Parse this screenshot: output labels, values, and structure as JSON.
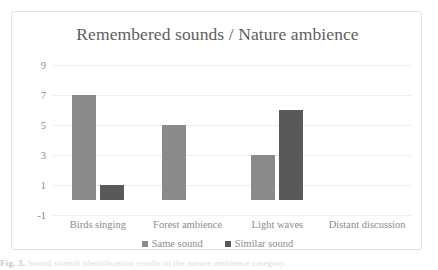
{
  "chart_data": {
    "type": "bar",
    "title": "Remembered sounds / Nature ambience",
    "xlabel": "",
    "ylabel": "",
    "categories": [
      "Birds singing",
      "Forest ambience",
      "Light waves",
      "Distant discussion"
    ],
    "series": [
      {
        "name": "Same sound",
        "color": "#8a8a8a",
        "values": [
          7,
          5,
          3,
          0
        ]
      },
      {
        "name": "Similar sound",
        "color": "#595959",
        "values": [
          1,
          0,
          6,
          0
        ]
      }
    ],
    "ylim": [
      -1,
      9
    ],
    "yticks": [
      9,
      7,
      5,
      3,
      1,
      -1
    ],
    "grid": true,
    "legend_position": "bottom"
  },
  "axis": {
    "ticks": [
      {
        "label": "9",
        "value": 9
      },
      {
        "label": "7",
        "value": 7
      },
      {
        "label": "5",
        "value": 5
      },
      {
        "label": "3",
        "value": 3
      },
      {
        "label": "1",
        "value": 1
      },
      {
        "label": "-1",
        "value": -1
      }
    ]
  },
  "legend": {
    "items": [
      {
        "label": "Same sound",
        "color": "#8a8a8a"
      },
      {
        "label": "Similar sound",
        "color": "#595959"
      }
    ]
  },
  "caption": {
    "prefix": "Fig. 3.",
    "text": "Sound stimuli identification results in the nature ambience category."
  }
}
